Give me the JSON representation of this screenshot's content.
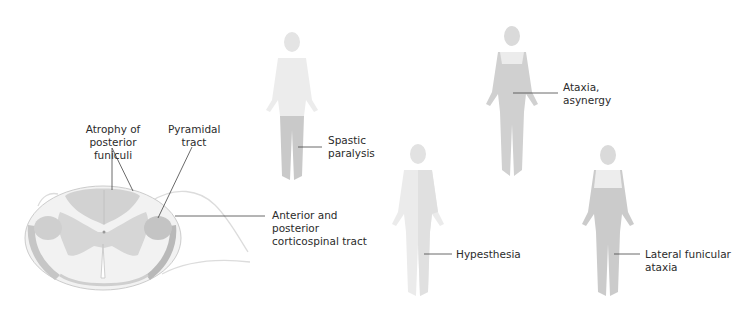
{
  "diagram": {
    "type": "anatomical-illustration"
  },
  "spinal_cord": {
    "labels": {
      "posterior_funiculi": [
        "Atrophy of",
        "posterior funiculi"
      ],
      "pyramidal": [
        "Pyramidal",
        "tract"
      ],
      "corticospinal": [
        "Anterior and",
        "posterior",
        "corticospinal tract"
      ]
    }
  },
  "figures": [
    {
      "id": "spastic",
      "label": [
        "Spastic",
        "paralysis"
      ],
      "shaded_region": "legs"
    },
    {
      "id": "ataxia",
      "label": [
        "Ataxia,",
        "asynergy"
      ],
      "shaded_region": "trunk-and-limbs"
    },
    {
      "id": "hypesthesia",
      "label": [
        "Hypesthesia"
      ],
      "shaded_region": "light-whole-body"
    },
    {
      "id": "lateral",
      "label": [
        "Lateral funicular",
        "ataxia"
      ],
      "shaded_region": "below-shoulders"
    }
  ],
  "colors": {
    "cord_gray": "#d2d2d2",
    "cord_white": "#f4f4f4",
    "cord_outline": "#c8c8c8",
    "tract_dark": "#b9b9b9",
    "body_light": "#ececec",
    "body_shaded": "#cfcfcf",
    "leader": "#444444",
    "text": "#2b2b2b"
  }
}
